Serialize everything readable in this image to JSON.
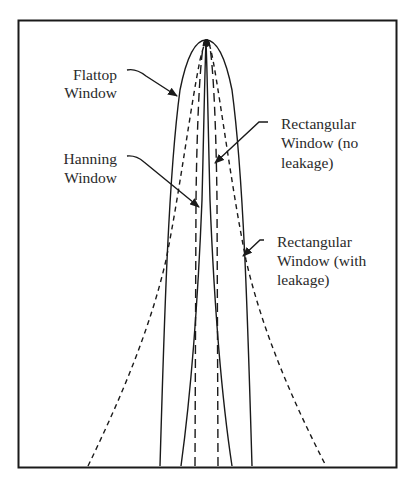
{
  "diagram": {
    "title": "",
    "labels": {
      "flattop": [
        "Flattop",
        "Window"
      ],
      "hanning": [
        "Hanning",
        "Window"
      ],
      "rect_no_leak": [
        "Rectangular",
        "Window (no",
        "leakage)"
      ],
      "rect_leak": [
        "Rectangular",
        "Window (with",
        "leakage)"
      ]
    },
    "curves": [
      {
        "name": "Flattop Window",
        "style": "solid",
        "width": "widest solid"
      },
      {
        "name": "Hanning Window",
        "style": "solid",
        "width": "narrow solid"
      },
      {
        "name": "Rectangular Window (no leakage)",
        "style": "long-dash",
        "width": "narrowest"
      },
      {
        "name": "Rectangular Window (with leakage)",
        "style": "short-dash",
        "width": "widest, long tails"
      }
    ],
    "colors": {
      "line": "#1a1a1a",
      "background": "#ffffff"
    }
  }
}
